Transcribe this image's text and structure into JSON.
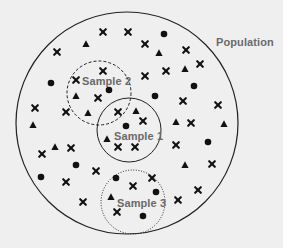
{
  "colors": {
    "background": "#efefef",
    "ink": "#111111",
    "label": "#6a6a6a",
    "sample_fill": "#efefef"
  },
  "population": {
    "label": "Population",
    "label_pos": [
      216,
      46
    ],
    "circle": {
      "cx": 127,
      "cy": 123,
      "r": 111
    }
  },
  "samples": [
    {
      "label": "Sample 1",
      "label_pos": [
        114,
        140
      ],
      "circle": {
        "cx": 129,
        "cy": 130,
        "r": 32
      },
      "style": "solid"
    },
    {
      "label": "Sample 2",
      "label_pos": [
        82,
        85
      ],
      "circle": {
        "cx": 99,
        "cy": 93,
        "r": 32
      },
      "style": "dashed"
    },
    {
      "label": "Sample 3",
      "label_pos": [
        117,
        207
      ],
      "circle": {
        "cx": 133,
        "cy": 202,
        "r": 32
      },
      "style": "dotted"
    }
  ],
  "legend_shapes": [
    "cross",
    "triangle",
    "circle"
  ],
  "points": [
    {
      "shape": "cross",
      "x": 103,
      "y": 32
    },
    {
      "shape": "cross",
      "x": 128,
      "y": 32
    },
    {
      "shape": "circle",
      "x": 164,
      "y": 34
    },
    {
      "shape": "triangle",
      "x": 86,
      "y": 44
    },
    {
      "shape": "cross",
      "x": 145,
      "y": 44
    },
    {
      "shape": "cross",
      "x": 57,
      "y": 52
    },
    {
      "shape": "triangle",
      "x": 159,
      "y": 53
    },
    {
      "shape": "cross",
      "x": 186,
      "y": 50
    },
    {
      "shape": "cross",
      "x": 200,
      "y": 64
    },
    {
      "shape": "triangle",
      "x": 185,
      "y": 69
    },
    {
      "shape": "cross",
      "x": 166,
      "y": 71
    },
    {
      "shape": "cross",
      "x": 145,
      "y": 76
    },
    {
      "shape": "cross",
      "x": 103,
      "y": 71
    },
    {
      "shape": "circle",
      "x": 51,
      "y": 83
    },
    {
      "shape": "cross",
      "x": 76,
      "y": 80
    },
    {
      "shape": "circle",
      "x": 194,
      "y": 86
    },
    {
      "shape": "triangle",
      "x": 76,
      "y": 96
    },
    {
      "shape": "circle",
      "x": 109,
      "y": 90
    },
    {
      "shape": "cross",
      "x": 98,
      "y": 98
    },
    {
      "shape": "circle",
      "x": 155,
      "y": 96
    },
    {
      "shape": "cross",
      "x": 183,
      "y": 101
    },
    {
      "shape": "cross",
      "x": 35,
      "y": 108
    },
    {
      "shape": "cross",
      "x": 66,
      "y": 112
    },
    {
      "shape": "triangle",
      "x": 88,
      "y": 113
    },
    {
      "shape": "cross",
      "x": 118,
      "y": 112
    },
    {
      "shape": "triangle",
      "x": 136,
      "y": 111
    },
    {
      "shape": "cross",
      "x": 218,
      "y": 105
    },
    {
      "shape": "cross",
      "x": 143,
      "y": 121
    },
    {
      "shape": "triangle",
      "x": 33,
      "y": 125
    },
    {
      "shape": "circle",
      "x": 126,
      "y": 126
    },
    {
      "shape": "triangle",
      "x": 176,
      "y": 122
    },
    {
      "shape": "cross",
      "x": 191,
      "y": 123
    },
    {
      "shape": "triangle",
      "x": 224,
      "y": 124
    },
    {
      "shape": "triangle",
      "x": 107,
      "y": 139
    },
    {
      "shape": "circle",
      "x": 208,
      "y": 142
    },
    {
      "shape": "cross",
      "x": 118,
      "y": 147
    },
    {
      "shape": "cross",
      "x": 135,
      "y": 147
    },
    {
      "shape": "cross",
      "x": 176,
      "y": 145
    },
    {
      "shape": "triangle",
      "x": 55,
      "y": 147
    },
    {
      "shape": "cross",
      "x": 71,
      "y": 148
    },
    {
      "shape": "cross",
      "x": 42,
      "y": 154
    },
    {
      "shape": "circle",
      "x": 76,
      "y": 165
    },
    {
      "shape": "triangle",
      "x": 185,
      "y": 165
    },
    {
      "shape": "cross",
      "x": 212,
      "y": 164
    },
    {
      "shape": "cross",
      "x": 96,
      "y": 171
    },
    {
      "shape": "circle",
      "x": 41,
      "y": 177
    },
    {
      "shape": "circle",
      "x": 116,
      "y": 178
    },
    {
      "shape": "cross",
      "x": 152,
      "y": 178
    },
    {
      "shape": "cross",
      "x": 66,
      "y": 182
    },
    {
      "shape": "cross",
      "x": 133,
      "y": 186
    },
    {
      "shape": "circle",
      "x": 156,
      "y": 192
    },
    {
      "shape": "cross",
      "x": 198,
      "y": 190
    },
    {
      "shape": "triangle",
      "x": 111,
      "y": 197
    },
    {
      "shape": "cross",
      "x": 178,
      "y": 200
    },
    {
      "shape": "cross",
      "x": 83,
      "y": 202
    },
    {
      "shape": "cross",
      "x": 117,
      "y": 212
    },
    {
      "shape": "circle",
      "x": 143,
      "y": 216
    }
  ]
}
